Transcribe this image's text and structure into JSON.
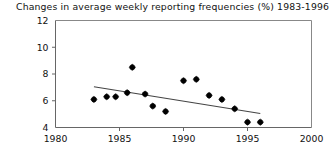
{
  "chart_data": {
    "type": "scatter",
    "title": "Changes in average weekly reporting frequencies (%) 1983-1996",
    "xlabel": "",
    "ylabel": "",
    "xlim": [
      1980,
      2000
    ],
    "ylim": [
      4,
      12
    ],
    "xticks": [
      1980,
      1985,
      1990,
      1995,
      2000
    ],
    "xticklabels": [
      "1980",
      "1985",
      "1990",
      "1995",
      "2000"
    ],
    "yticks": [
      4,
      6,
      8,
      10,
      12
    ],
    "yticklabels": [
      "4",
      "6",
      "8",
      "10",
      "12"
    ],
    "grid": false,
    "legend": null,
    "marker": "filled-diamond",
    "marker_color": "#000000",
    "line_color": "#444444",
    "frame_color": "#888888",
    "x": [
      1983.0,
      1984.0,
      1984.7,
      1985.6,
      1986.0,
      1987.0,
      1987.6,
      1988.6,
      1990.0,
      1991.0,
      1992.0,
      1993.0,
      1994.0,
      1995.0,
      1996.0
    ],
    "y": [
      6.1,
      6.3,
      6.3,
      6.6,
      8.5,
      6.5,
      5.6,
      5.2,
      7.5,
      7.6,
      6.4,
      6.1,
      5.4,
      4.4,
      4.4
    ],
    "series": [
      {
        "name": "weekly reporting frequency",
        "points": [
          {
            "x": 1983.0,
            "y": 6.1
          },
          {
            "x": 1984.0,
            "y": 6.3
          },
          {
            "x": 1984.7,
            "y": 6.3
          },
          {
            "x": 1985.6,
            "y": 6.6
          },
          {
            "x": 1986.0,
            "y": 8.5
          },
          {
            "x": 1987.0,
            "y": 6.5
          },
          {
            "x": 1987.6,
            "y": 5.6
          },
          {
            "x": 1988.6,
            "y": 5.2
          },
          {
            "x": 1990.0,
            "y": 7.5
          },
          {
            "x": 1991.0,
            "y": 7.6
          },
          {
            "x": 1992.0,
            "y": 6.4
          },
          {
            "x": 1993.0,
            "y": 6.1
          },
          {
            "x": 1994.0,
            "y": 5.4
          },
          {
            "x": 1995.0,
            "y": 4.4
          },
          {
            "x": 1996.0,
            "y": 4.4
          }
        ]
      }
    ],
    "trendline": {
      "x_start": 1983.0,
      "y_start": 7.05,
      "x_end": 1996.0,
      "y_end": 5.05
    }
  }
}
